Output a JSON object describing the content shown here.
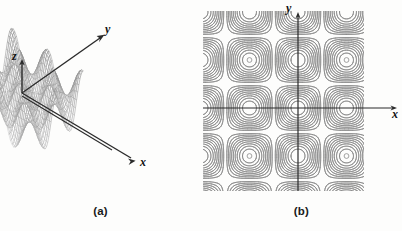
{
  "figure": {
    "background_color": "#fdfdfc",
    "line_color": "#3a3a3a",
    "contour_color": "#8a8a8a",
    "panels": [
      {
        "id": "a",
        "caption": "(a)",
        "kind": "surface-3d",
        "axes": [
          {
            "name": "z-axis",
            "label": "z",
            "direction": "up"
          },
          {
            "name": "y-axis",
            "label": "y",
            "direction": "up-right"
          },
          {
            "name": "x-axis",
            "label": "x",
            "direction": "down-right"
          }
        ]
      },
      {
        "id": "b",
        "caption": "(b)",
        "kind": "contour-plot",
        "axes": [
          {
            "name": "y-axis",
            "label": "y",
            "direction": "up"
          },
          {
            "name": "x-axis",
            "label": "x",
            "direction": "right"
          }
        ]
      }
    ]
  },
  "chart_data": [
    {
      "type": "surface",
      "panel": "(a)",
      "title": "",
      "function": "z = cos(x) cos(y)",
      "xlabel": "x",
      "ylabel": "y",
      "zlabel": "z",
      "xlim": [
        -6.283,
        6.283
      ],
      "ylim": [
        -6.283,
        6.283
      ],
      "zlim": [
        -1,
        1
      ],
      "grid": true,
      "legend": false,
      "mesh": "wireframe",
      "description": "Egg-crate periodic surface with alternating hills and valleys drawn as a fine cross-hatched wireframe, viewed in oblique projection with z vertical, y receding up-right and x advancing down-right."
    },
    {
      "type": "contour",
      "panel": "(b)",
      "title": "",
      "function": "z = cos(x) cos(y)",
      "xlabel": "x",
      "ylabel": "y",
      "xlim": [
        -6.283,
        6.283
      ],
      "ylim": [
        -6.283,
        6.283
      ],
      "grid": false,
      "legend": false,
      "levels": [
        -0.9,
        -0.8,
        -0.7,
        -0.6,
        -0.5,
        -0.4,
        -0.3,
        -0.2,
        -0.1,
        0.1,
        0.2,
        0.3,
        0.4,
        0.5,
        0.6,
        0.7,
        0.8,
        0.9
      ],
      "extrema": [
        {
          "label": "peak",
          "x": -3.142,
          "y": 3.142,
          "value": 1
        },
        {
          "label": "peak",
          "x": 3.142,
          "y": 3.142,
          "value": 1
        },
        {
          "label": "peak",
          "x": -3.142,
          "y": -3.142,
          "value": 1
        },
        {
          "label": "peak",
          "x": 3.142,
          "y": -3.142,
          "value": 1
        },
        {
          "label": "saddle",
          "x": 0,
          "y": 0,
          "value": 1
        }
      ],
      "description": "Concentric rounded-square closed contour rings centred on four extrema, one per quadrant, squaring off toward the saddle lines; x and y axes drawn as plain arrows through the origin."
    }
  ]
}
